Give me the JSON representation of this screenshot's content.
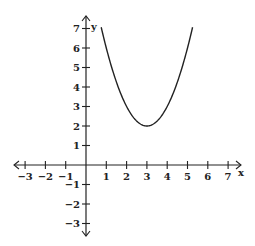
{
  "chart_data": {
    "type": "line",
    "title": "",
    "xlabel": "x",
    "ylabel": "y",
    "xlim": [
      -3,
      7
    ],
    "ylim": [
      -3,
      7
    ],
    "x_ticks": [
      -3,
      -2,
      -1,
      1,
      2,
      3,
      4,
      5,
      6,
      7
    ],
    "y_ticks": [
      -3,
      -2,
      -1,
      1,
      2,
      3,
      4,
      5,
      6,
      7
    ],
    "grid": false,
    "legend": null,
    "function": "y = (x - 3)^2 + 2",
    "vertex": [
      3,
      2
    ],
    "series": [
      {
        "name": "parabola",
        "x": [
          0.75,
          1.0,
          1.5,
          2.0,
          2.5,
          3.0,
          3.5,
          4.0,
          4.5,
          5.0,
          5.25
        ],
        "values": [
          7.06,
          6.0,
          4.25,
          3.0,
          2.25,
          2.0,
          2.25,
          3.0,
          4.25,
          6.0,
          7.06
        ]
      }
    ]
  },
  "axes": {
    "x_label": "x",
    "y_label": "y"
  }
}
